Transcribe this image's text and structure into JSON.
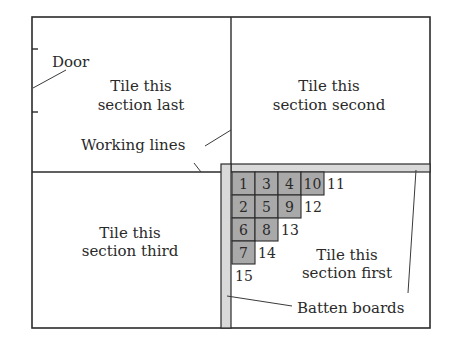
{
  "diagram": {
    "labels": {
      "door": "Door",
      "working_lines": "Working lines",
      "batten_boards": "Batten boards"
    },
    "sections": {
      "top_left": [
        "Tile this",
        "section last"
      ],
      "top_right": [
        "Tile this",
        "section second"
      ],
      "bottom_left": [
        "Tile this",
        "section third"
      ],
      "bottom_right": [
        "Tile this",
        "section first"
      ]
    },
    "tiles": {
      "placed": [
        {
          "n": "1",
          "row": 0,
          "col": 0
        },
        {
          "n": "3",
          "row": 0,
          "col": 1
        },
        {
          "n": "4",
          "row": 0,
          "col": 2
        },
        {
          "n": "10",
          "row": 0,
          "col": 3
        },
        {
          "n": "2",
          "row": 1,
          "col": 0
        },
        {
          "n": "5",
          "row": 1,
          "col": 1
        },
        {
          "n": "9",
          "row": 1,
          "col": 2
        },
        {
          "n": "6",
          "row": 2,
          "col": 0
        },
        {
          "n": "8",
          "row": 2,
          "col": 1
        },
        {
          "n": "7",
          "row": 3,
          "col": 0
        }
      ],
      "next": [
        {
          "n": "11",
          "row": 0,
          "col": 4
        },
        {
          "n": "12",
          "row": 1,
          "col": 3
        },
        {
          "n": "13",
          "row": 2,
          "col": 2
        },
        {
          "n": "14",
          "row": 3,
          "col": 1
        },
        {
          "n": "15",
          "row": 4,
          "col": 0
        }
      ]
    },
    "colors": {
      "tile": "#a9a9a9",
      "batten": "#d9d9d9",
      "line": "#2b2b2b"
    }
  }
}
